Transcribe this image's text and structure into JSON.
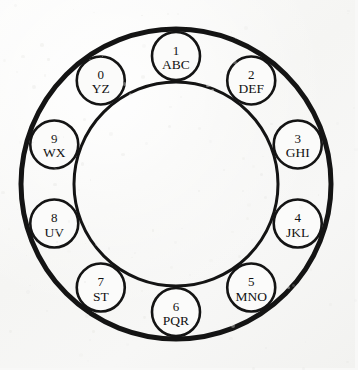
{
  "figure": {
    "background_color": "#f8f8f7",
    "ink_color": "#141414"
  },
  "dial": {
    "center_x": 176,
    "center_y": 184,
    "outer_ring_radius": 155,
    "outer_ring_stroke": 5,
    "inner_ring_radius": 102,
    "inner_ring_stroke": 3,
    "key_orbit_radius": 128,
    "key_radius": 24,
    "key_count": 10,
    "angle_step_degrees": 36,
    "start_angle_degrees": -90,
    "direction": "clockwise"
  },
  "keys": [
    {
      "digit": "1",
      "letters": "ABC",
      "angle": -90
    },
    {
      "digit": "2",
      "letters": "DEF",
      "angle": -54
    },
    {
      "digit": "3",
      "letters": "GHI",
      "angle": -18
    },
    {
      "digit": "4",
      "letters": "JKL",
      "angle": 18
    },
    {
      "digit": "5",
      "letters": "MNO",
      "angle": 54
    },
    {
      "digit": "6",
      "letters": "PQR",
      "angle": 90
    },
    {
      "digit": "7",
      "letters": "ST",
      "angle": 126
    },
    {
      "digit": "8",
      "letters": "UV",
      "angle": 162
    },
    {
      "digit": "9",
      "letters": "WX",
      "angle": 198
    },
    {
      "digit": "0",
      "letters": "YZ",
      "angle": 234
    }
  ]
}
